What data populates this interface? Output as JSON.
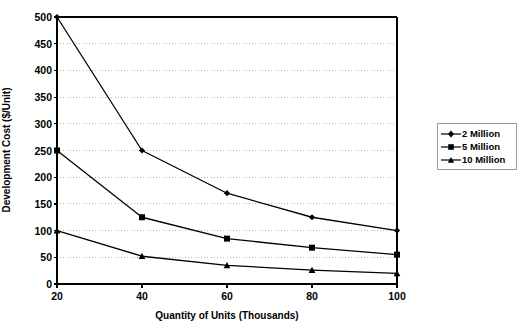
{
  "chart_data": {
    "type": "line",
    "title": "",
    "xlabel": "Quantity of Units (Thousands)",
    "ylabel": "Development Cost ($/Unit)",
    "x": [
      20,
      40,
      60,
      80,
      100
    ],
    "xtick_labels": [
      "20",
      "40",
      "60",
      "80",
      "100"
    ],
    "ytick_labels": [
      "0",
      "50",
      "100",
      "150",
      "200",
      "250",
      "300",
      "350",
      "400",
      "450",
      "500"
    ],
    "yticks": [
      0,
      50,
      100,
      150,
      200,
      250,
      300,
      350,
      400,
      450,
      500
    ],
    "xlim": [
      20,
      100
    ],
    "ylim": [
      0,
      500
    ],
    "grid": "horizontal-dotted",
    "legend_position": "right",
    "series": [
      {
        "name": "2 Million",
        "marker": "diamond",
        "values": [
          500,
          250,
          170,
          125,
          100
        ]
      },
      {
        "name": "5 Million",
        "marker": "square",
        "values": [
          250,
          125,
          85,
          68,
          55
        ]
      },
      {
        "name": "10 Million",
        "marker": "triangle",
        "values": [
          100,
          52,
          35,
          26,
          20
        ]
      }
    ]
  },
  "legend": {
    "items": [
      {
        "label": "2 Million",
        "marker": "diamond-marker-icon"
      },
      {
        "label": "5 Million",
        "marker": "square-marker-icon"
      },
      {
        "label": "10 Million",
        "marker": "triangle-marker-icon"
      }
    ]
  },
  "colors": {
    "line": "#000000",
    "marker": "#000000",
    "axis": "#000000",
    "grid": "#b5b5b5",
    "background": "#ffffff",
    "legend_border": "#9a9a9a"
  }
}
